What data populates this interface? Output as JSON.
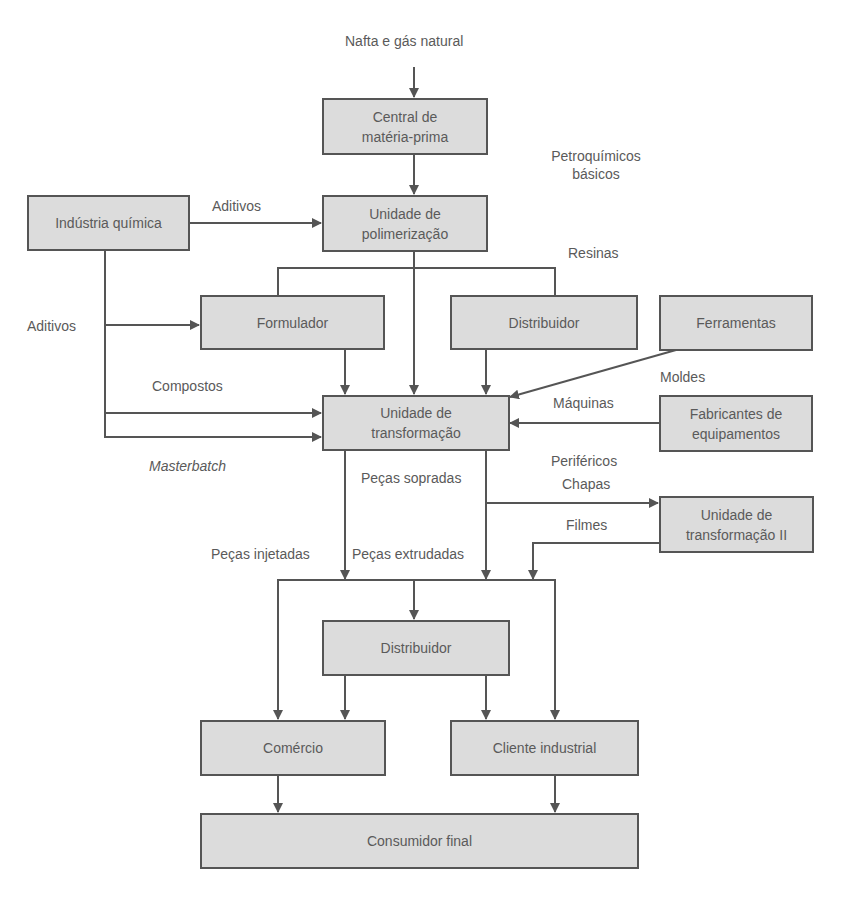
{
  "diagram": {
    "colors": {
      "box_fill": "#dcdcdc",
      "line": "#555555",
      "text": "#5a5a5a"
    },
    "nodes": {
      "central": {
        "line1": "Central de",
        "line2": "matéria-prima"
      },
      "polimerizacao": {
        "line1": "Unidade de",
        "line2": "polimerização"
      },
      "industria_quimica": {
        "label": "Indústria química"
      },
      "formulador": {
        "label": "Formulador"
      },
      "distribuidor_top": {
        "label": "Distribuidor"
      },
      "ferramentas": {
        "label": "Ferramentas"
      },
      "transformacao": {
        "line1": "Unidade de",
        "line2": "transformação"
      },
      "fabricantes": {
        "line1": "Fabricantes de",
        "line2": "equipamentos"
      },
      "transformacao_ii": {
        "line1": "Unidade de",
        "line2": "transformação II"
      },
      "distribuidor_bottom": {
        "label": "Distribuidor"
      },
      "comercio": {
        "label": "Comércio"
      },
      "cliente_industrial": {
        "label": "Cliente industrial"
      },
      "consumidor_final": {
        "label": "Consumidor final"
      }
    },
    "edge_labels": {
      "nafta": "Nafta e gás natural",
      "petroquimicos_1": "Petroquímicos",
      "petroquimicos_2": "básicos",
      "aditivos_top": "Aditivos",
      "resinas": "Resinas",
      "aditivos_left": "Aditivos",
      "compostos": "Compostos",
      "masterbatch": "Masterbatch",
      "moldes": "Moldes",
      "maquinas": "Máquinas",
      "perifericos": "Periféricos",
      "chapas": "Chapas",
      "filmes": "Filmes",
      "pecas_sopradas": "Peças sopradas",
      "pecas_injetadas": "Peças injetadas",
      "pecas_extrudadas": "Peças extrudadas"
    }
  }
}
